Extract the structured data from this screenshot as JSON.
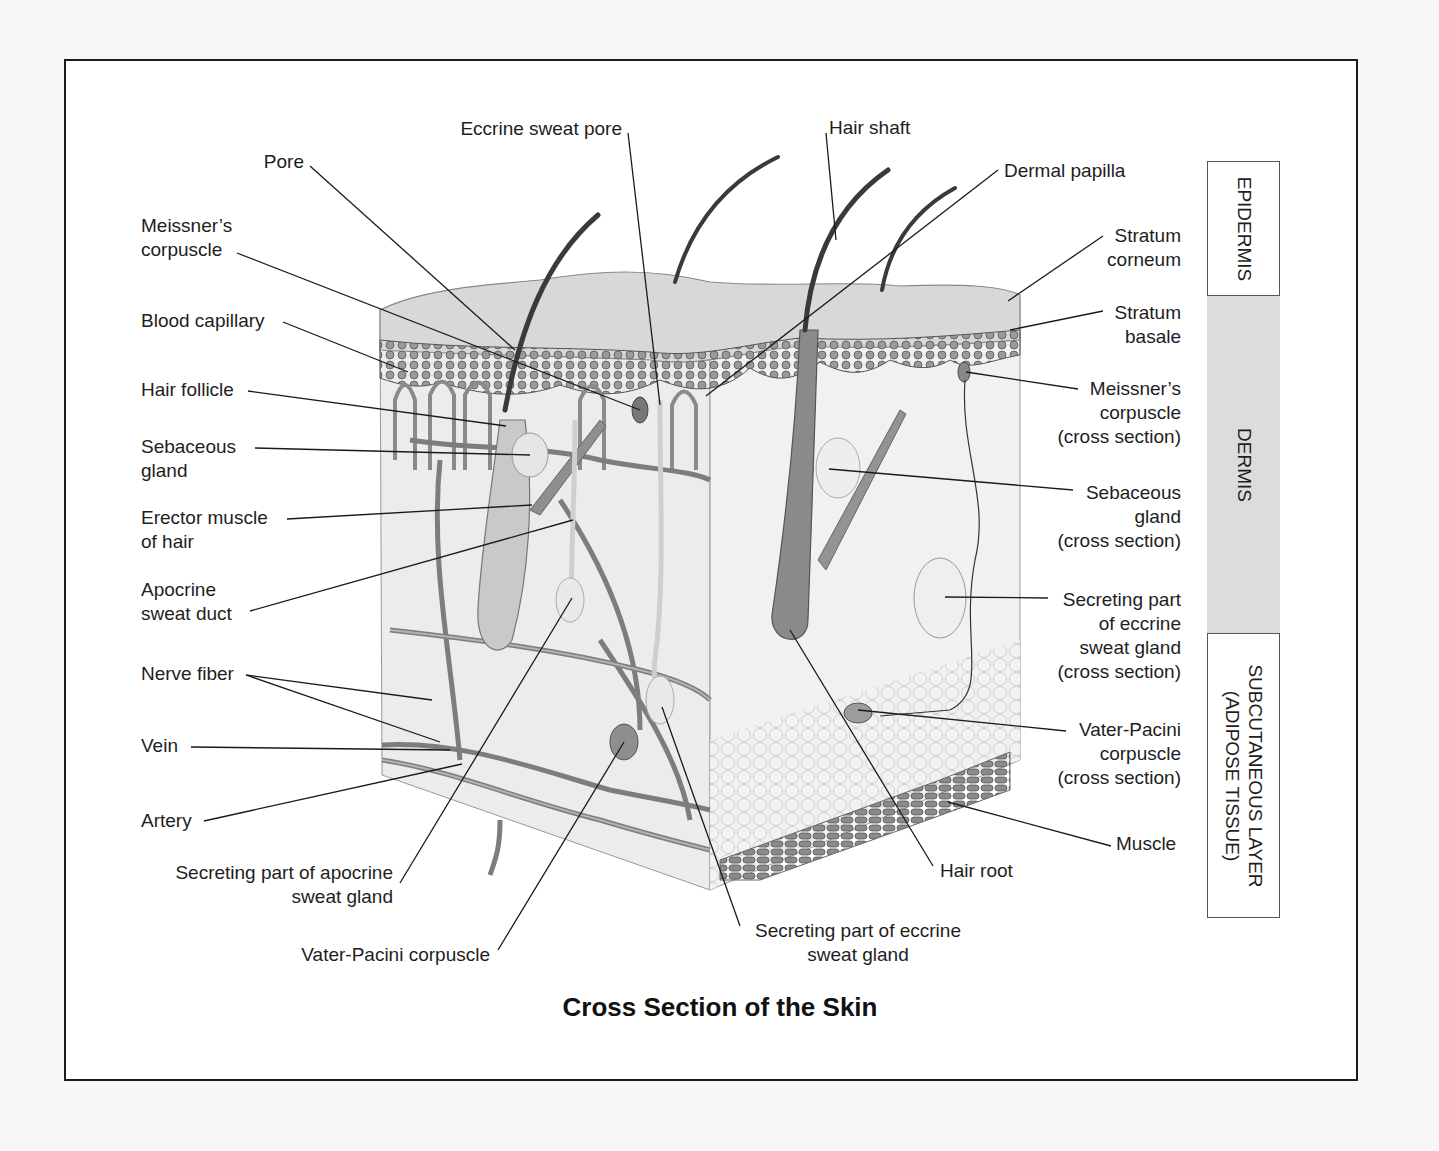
{
  "figure": {
    "title": "Cross Section of the Skin"
  },
  "labels_left": {
    "pore": "Pore",
    "eccrine_sweat_pore": "Eccrine sweat pore",
    "meissners_corpuscle_l1": "Meissner’s",
    "meissners_corpuscle_l2": "corpuscle",
    "blood_capillary": "Blood capillary",
    "hair_follicle": "Hair follicle",
    "sebaceous_gland_l1": "Sebaceous",
    "sebaceous_gland_l2": "gland",
    "erector_muscle_l1": "Erector muscle",
    "erector_muscle_l2": "of hair",
    "apocrine_duct_l1": "Apocrine",
    "apocrine_duct_l2": "sweat duct",
    "nerve_fiber": "Nerve fiber",
    "vein": "Vein",
    "artery": "Artery",
    "secreting_apocrine_l1": "Secreting part of apocrine",
    "secreting_apocrine_l2": "sweat gland",
    "vater_pacini": "Vater-Pacini corpuscle"
  },
  "labels_bottom": {
    "secreting_eccrine_l1": "Secreting part of eccrine",
    "secreting_eccrine_l2": "sweat gland",
    "hair_root": "Hair root"
  },
  "labels_right": {
    "hair_shaft": "Hair shaft",
    "dermal_papilla": "Dermal papilla",
    "stratum_corneum_l1": "Stratum",
    "stratum_corneum_l2": "corneum",
    "stratum_basale_l1": "Stratum",
    "stratum_basale_l2": "basale",
    "meissner_cs_l1": "Meissner’s",
    "meissner_cs_l2": "corpuscle",
    "meissner_cs_l3": "(cross section)",
    "sebaceous_cs_l1": "Sebaceous",
    "sebaceous_cs_l2": "gland",
    "sebaceous_cs_l3": "(cross section)",
    "eccrine_cs_l1": "Secreting part",
    "eccrine_cs_l2": "of eccrine",
    "eccrine_cs_l3": "sweat gland",
    "eccrine_cs_l4": "(cross section)",
    "vater_cs_l1": "Vater-Pacini",
    "vater_cs_l2": "corpuscle",
    "vater_cs_l3": "(cross section)",
    "muscle": "Muscle"
  },
  "layers": {
    "epidermis": "EPIDERMIS",
    "dermis": "DERMIS",
    "subcutaneous_l1": "SUBCUTANEOUS LAYER",
    "subcutaneous_l2": "(ADIPOSE TISSUE)"
  },
  "colors": {
    "page": "#f7f7f7",
    "frame_border": "#1c1c1c",
    "dermis_band": "#dcdcdc",
    "tissue_light": "#e9e9e9",
    "tissue_mid": "#b5b5b5",
    "tissue_dark": "#6f6f6f"
  }
}
